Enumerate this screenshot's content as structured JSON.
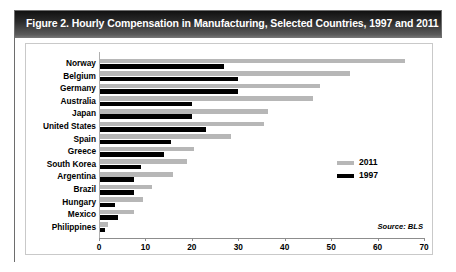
{
  "figure": {
    "title": "Figure 2. Hourly Compensation in Manufacturing, Selected Countries, 1997 and 2011",
    "source_note": "Source: BLS"
  },
  "legend": {
    "position": "inside-right",
    "entries": [
      {
        "label": "2011",
        "color": "#b7b7b7"
      },
      {
        "label": "1997",
        "color": "#000000"
      }
    ]
  },
  "chart_data": {
    "type": "bar",
    "orientation": "horizontal",
    "title": "Figure 2. Hourly Compensation in Manufacturing, Selected Countries, 1997 and 2011",
    "xlabel": "",
    "ylabel": "",
    "xlim": [
      0,
      70
    ],
    "xticks": [
      0,
      10,
      20,
      30,
      40,
      50,
      60,
      70
    ],
    "grid": false,
    "categories": [
      "Norway",
      "Belgium",
      "Germany",
      "Australia",
      "Japan",
      "United States",
      "Spain",
      "Greece",
      "South Korea",
      "Argentina",
      "Brazil",
      "Hungary",
      "Mexico",
      "Philippines"
    ],
    "series": [
      {
        "name": "2011",
        "color": "#b7b7b7",
        "values": [
          66,
          54,
          47.5,
          46,
          36.5,
          35.5,
          28.5,
          20.5,
          19,
          16,
          11.5,
          9.5,
          7.5,
          2
        ]
      },
      {
        "name": "1997",
        "color": "#000000",
        "values": [
          27,
          30,
          30,
          20,
          20,
          23,
          15.5,
          14,
          9,
          7.5,
          7.5,
          3.5,
          4,
          1.2
        ]
      }
    ]
  }
}
